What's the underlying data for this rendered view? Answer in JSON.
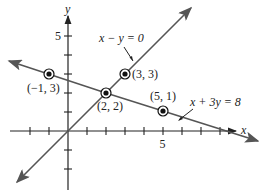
{
  "diagram": {
    "type": "coordinate-plane",
    "axes": {
      "x_label": "x",
      "y_label": "y",
      "x_tick_label": "5",
      "y_tick_label": "5"
    },
    "lines": [
      {
        "equation": "x − y = 0",
        "label": "x − y = 0"
      },
      {
        "equation": "x + 3y = 8",
        "label": "x + 3y = 8"
      }
    ],
    "points": [
      {
        "label": "(−1, 3)",
        "x": -1,
        "y": 3
      },
      {
        "label": "(2, 2)",
        "x": 2,
        "y": 2
      },
      {
        "label": "(3, 3)",
        "x": 3,
        "y": 3
      },
      {
        "label": "(5, 1)",
        "x": 5,
        "y": 1
      }
    ],
    "colors": {
      "line": "#555555",
      "axis": "#222222",
      "point": "#111111"
    }
  }
}
